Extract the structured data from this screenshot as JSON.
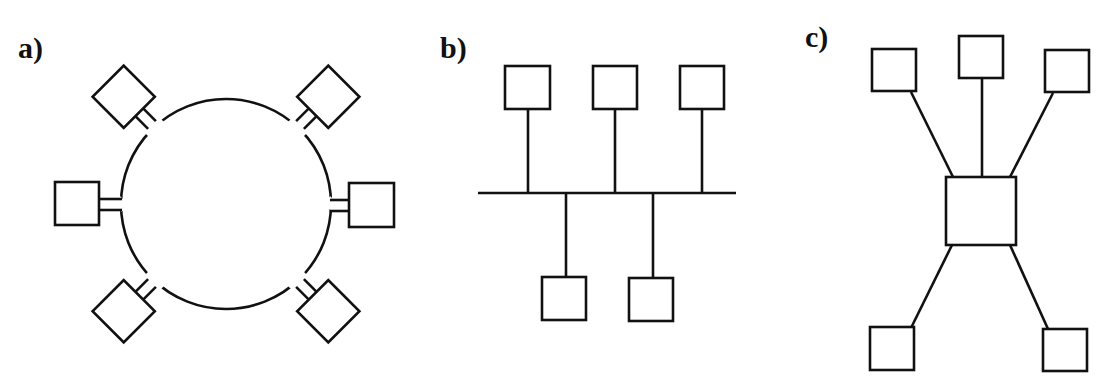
{
  "figure": {
    "panels": [
      {
        "id": "a",
        "label": "a)",
        "topology": "ring",
        "node_count": 6,
        "nodes": [
          "upper-left",
          "upper-right",
          "left",
          "right",
          "lower-left",
          "lower-right"
        ]
      },
      {
        "id": "b",
        "label": "b)",
        "topology": "bus",
        "node_count": 5,
        "nodes_above_bus": 3,
        "nodes_below_bus": 2
      },
      {
        "id": "c",
        "label": "c)",
        "topology": "star",
        "node_count": 5,
        "hub": "central-box",
        "nodes_top": 3,
        "nodes_bottom": 2
      }
    ],
    "colors": {
      "line": "#111111",
      "background": "#ffffff"
    }
  }
}
